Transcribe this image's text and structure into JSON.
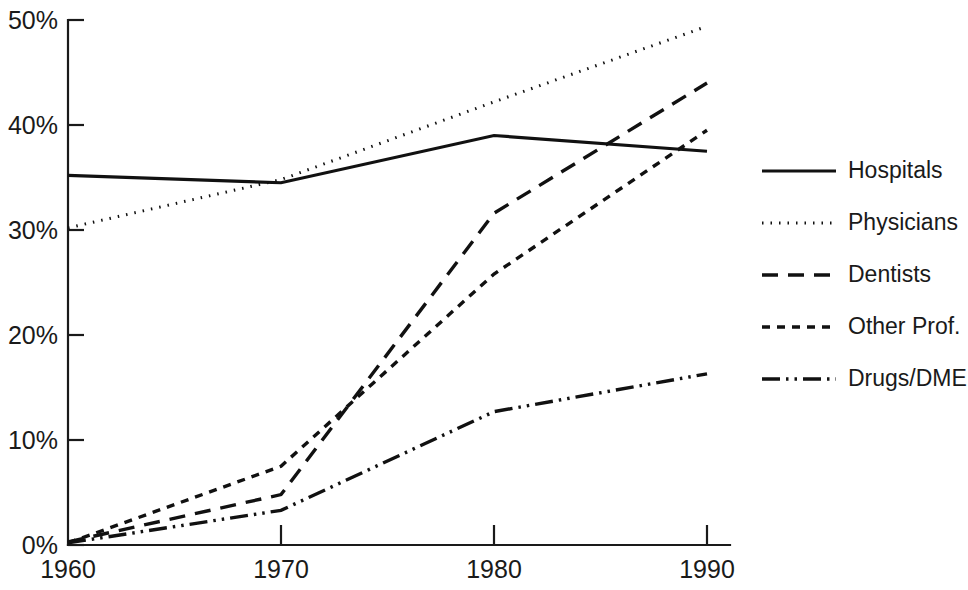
{
  "chart_data": {
    "type": "line",
    "title": "",
    "subtitle": "",
    "xlabel": "",
    "ylabel": "",
    "x": [
      1960,
      1970,
      1980,
      1990
    ],
    "xtick_labels": [
      "1960",
      "1970",
      "1980",
      "1990"
    ],
    "ytick_labels": [
      "0%",
      "10%",
      "20%",
      "30%",
      "40%",
      "50%"
    ],
    "ytick_values": [
      0,
      10,
      20,
      30,
      40,
      50
    ],
    "xlim": [
      1960,
      1990
    ],
    "ylim": [
      0,
      50
    ],
    "grid": false,
    "legend_position": "right",
    "units": "percent",
    "series": [
      {
        "name": "Hospitals",
        "dash": "solid",
        "stroke_width": 3.2,
        "dasharray": "none",
        "values": [
          35.2,
          34.5,
          39.0,
          37.5
        ]
      },
      {
        "name": "Physicians",
        "dash": "dotted",
        "stroke_width": 3.0,
        "dasharray": "1.5 7",
        "values": [
          30.2,
          34.8,
          42.2,
          49.4
        ]
      },
      {
        "name": "Dentists",
        "dash": "long-dash",
        "stroke_width": 3.4,
        "dasharray": "16 10",
        "values": [
          0.3,
          4.8,
          31.6,
          44.0
        ]
      },
      {
        "name": "Other Prof.",
        "dash": "short-dash",
        "stroke_width": 3.4,
        "dasharray": "8 7",
        "values": [
          0.2,
          7.5,
          25.8,
          39.5
        ]
      },
      {
        "name": "Drugs/DME",
        "dash": "dash-dot-dot",
        "stroke_width": 3.4,
        "dasharray": "18 6 2.5 6 2.5 6",
        "values": [
          0.2,
          3.3,
          12.7,
          16.3
        ]
      }
    ]
  },
  "legend": {
    "items": [
      {
        "label": "Hospitals"
      },
      {
        "label": "Physicians"
      },
      {
        "label": "Dentists"
      },
      {
        "label": "Other Prof."
      },
      {
        "label": "Drugs/DME"
      }
    ]
  },
  "footer": {
    "credit": "Webb . Daniel P."
  },
  "colors": {
    "ink": "#111111",
    "background": "#ffffff",
    "faint": "#b9b9b9"
  }
}
